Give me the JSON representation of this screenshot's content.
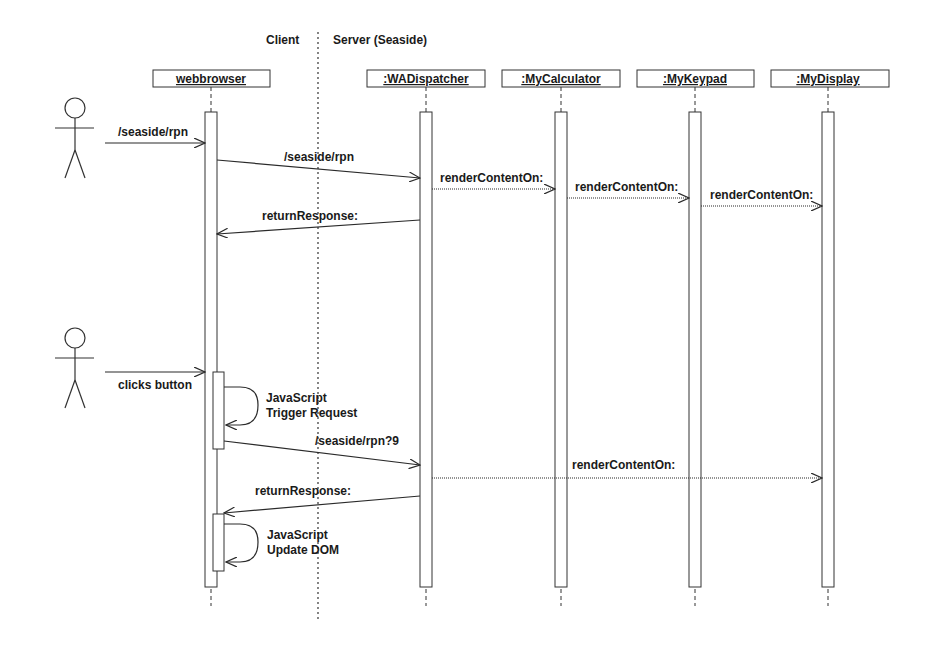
{
  "regions": {
    "client_label": "Client",
    "server_label": "Server (Seaside)"
  },
  "lifelines": [
    {
      "name": "webbrowser",
      "x": 211
    },
    {
      "name": ":WADispatcher",
      "x": 426
    },
    {
      "name": ":MyCalculator",
      "x": 561
    },
    {
      "name": ":MyKeypad",
      "x": 695
    },
    {
      "name": ":MyDisplay",
      "x": 828
    }
  ],
  "messages": {
    "m1": "/seaside/rpn",
    "m2": "/seaside/rpn",
    "m3": "renderContentOn:",
    "m4": "renderContentOn:",
    "m5": "renderContentOn:",
    "m6": "returnResponse:",
    "m7": "clicks button",
    "m8_line1": "JavaScript",
    "m8_line2": "Trigger Request",
    "m9": "/seaside/rpn?9",
    "m10": "renderContentOn:",
    "m11": "returnResponse:",
    "m12_line1": "JavaScript",
    "m12_line2": "Update DOM"
  },
  "colors": {
    "line": "#2a2a2a",
    "background": "#ffffff"
  }
}
